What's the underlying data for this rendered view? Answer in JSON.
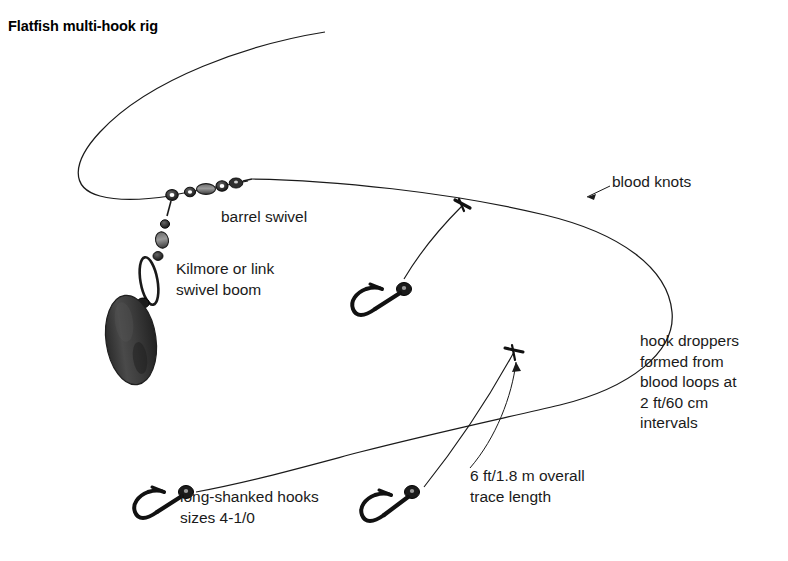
{
  "figure": {
    "title": "Flatfish multi-hook rig",
    "background_color": "#ffffff",
    "line_color": "#1a1a1a",
    "text_color": "#1a1a1a",
    "lead_weight_color": "#3a3a3a",
    "hardware_color": "#2b2b2b"
  },
  "labels": {
    "barrel_swivel": "barrel swivel",
    "swivel_boom": "Kilmore or link\nswivel boom",
    "blood_knots": "blood knots",
    "hook_droppers": "hook droppers\nformed from\nblood loops at\n2 ft/60 cm\nintervals",
    "hook_sizes": "long-shanked hooks\nsizes 4-1/0",
    "trace_length": "6 ft/1.8 m overall\ntrace length"
  },
  "components": {
    "mainline": "mainline",
    "trace": "trace",
    "lead_weight": "lead-weight",
    "link_boom": "link-boom",
    "swivel_cluster": "barrel-swivel-cluster",
    "hooks": [
      "hook-upper",
      "hook-lower-left",
      "hook-lower-center"
    ],
    "knots": [
      "blood-knot-upper",
      "blood-knot-lower"
    ]
  }
}
